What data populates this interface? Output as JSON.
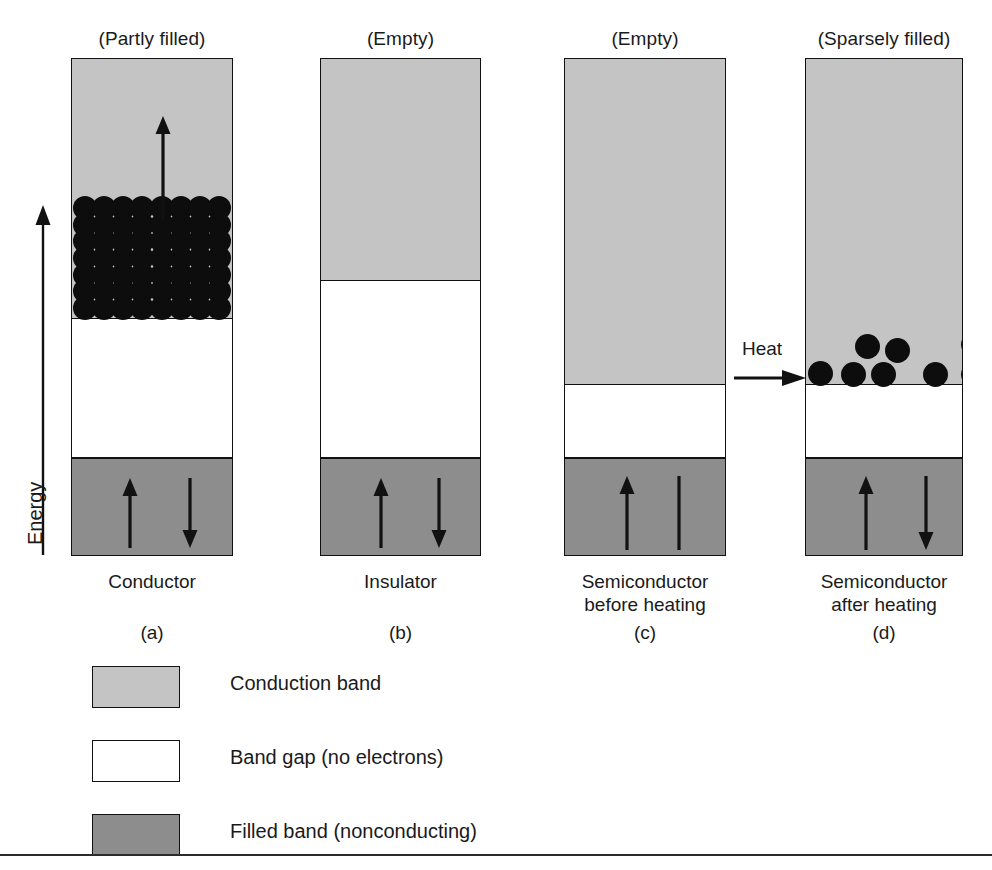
{
  "figure": {
    "axis": {
      "label": "Energy",
      "direction": "up"
    },
    "heat": {
      "label": "Heat",
      "arrow": "right-arrow-icon"
    }
  },
  "columns": [
    {
      "key": "conductor",
      "top_label": "(Partly filled)",
      "bottom_label": "Conductor",
      "panel_letter": "(a)",
      "x": 71,
      "width": 162,
      "y": 58,
      "height": 500,
      "bands": [
        {
          "type": "conduction",
          "label": "Conduction band",
          "top": 0,
          "height": 262
        },
        {
          "type": "gap",
          "label": "Band gap (no electrons)",
          "top": 262,
          "height": 140
        },
        {
          "type": "filled",
          "label": "Filled band (nonconducting)",
          "top": 402,
          "height": 98
        }
      ],
      "fill": {
        "style": "dense-lattice",
        "region_top": 138,
        "region_height": 124,
        "cols": 8,
        "rows": 7,
        "dot_diameter": 24
      },
      "arrows": [
        {
          "name": "conduction-up-arrow",
          "dir": "up",
          "x": 81,
          "y": 58,
          "length": 104
        },
        {
          "name": "filled-up-arrow",
          "dir": "up",
          "x": 48,
          "y": 420,
          "length": 70
        },
        {
          "name": "filled-down-arrow",
          "dir": "down",
          "x": 108,
          "y": 420,
          "length": 70
        }
      ]
    },
    {
      "key": "insulator",
      "top_label": "(Empty)",
      "bottom_label": "Insulator",
      "panel_letter": "(b)",
      "x": 320,
      "width": 161,
      "y": 58,
      "height": 500,
      "bands": [
        {
          "type": "conduction",
          "label": "Conduction band",
          "top": 0,
          "height": 224
        },
        {
          "type": "gap",
          "label": "Band gap (no electrons)",
          "top": 224,
          "height": 178
        },
        {
          "type": "filled",
          "label": "Filled band (nonconducting)",
          "top": 402,
          "height": 98
        }
      ],
      "fill": null,
      "arrows": [
        {
          "name": "filled-up-arrow",
          "dir": "up",
          "x": 50,
          "y": 420,
          "length": 70
        },
        {
          "name": "filled-down-arrow",
          "dir": "down",
          "x": 108,
          "y": 420,
          "length": 70
        }
      ]
    },
    {
      "key": "semiconductor-before",
      "top_label": "(Empty)",
      "bottom_label": "Semiconductor\nbefore heating",
      "panel_letter": "(c)",
      "x": 564,
      "width": 162,
      "y": 58,
      "height": 500,
      "bands": [
        {
          "type": "conduction",
          "label": "Conduction band",
          "top": 0,
          "height": 328
        },
        {
          "type": "gap",
          "label": "Band gap (no electrons)",
          "top": 328,
          "height": 74
        },
        {
          "type": "filled",
          "label": "Filled band (nonconducting)",
          "top": 402,
          "height": 98
        }
      ],
      "fill": null,
      "arrows": [
        {
          "name": "filled-up-arrow",
          "dir": "up",
          "x": 52,
          "y": 418,
          "length": 74
        },
        {
          "name": "filled-line",
          "dir": "line",
          "x": 104,
          "y": 418,
          "length": 74
        }
      ]
    },
    {
      "key": "semiconductor-after",
      "top_label": "(Sparsely filled)",
      "bottom_label": "Semiconductor\nafter heating",
      "panel_letter": "(d)",
      "x": 805,
      "width": 158,
      "y": 58,
      "height": 500,
      "bands": [
        {
          "type": "conduction",
          "label": "Conduction band",
          "top": 0,
          "height": 328
        },
        {
          "type": "gap",
          "label": "Band gap (no electrons)",
          "top": 328,
          "height": 74
        },
        {
          "type": "filled",
          "label": "Filled band (nonconducting)",
          "top": 402,
          "height": 98
        }
      ],
      "fill": {
        "style": "sparse-dots",
        "dot_diameter": 25,
        "dots": [
          {
            "cx": 15,
            "cy": 315
          },
          {
            "cx": 48,
            "cy": 316
          },
          {
            "cx": 78,
            "cy": 316
          },
          {
            "cx": 130,
            "cy": 316
          },
          {
            "cx": 168,
            "cy": 316
          },
          {
            "cx": 62,
            "cy": 288
          },
          {
            "cx": 92,
            "cy": 292
          },
          {
            "cx": 168,
            "cy": 286
          }
        ]
      },
      "arrows": [
        {
          "name": "filled-up-arrow",
          "dir": "up",
          "x": 50,
          "y": 418,
          "length": 74
        },
        {
          "name": "filled-down-arrow",
          "dir": "down",
          "x": 110,
          "y": 418,
          "length": 74
        }
      ]
    }
  ],
  "legend": [
    {
      "type": "conduction",
      "label": "Conduction band"
    },
    {
      "type": "gap",
      "label": "Band gap (no electrons)"
    },
    {
      "type": "filled",
      "label": "Filled band (nonconducting)"
    }
  ],
  "colors": {
    "conduction_band": "#c4c4c4",
    "band_gap": "#ffffff",
    "filled_band": "#8d8d8d",
    "electron": "#0d0d0d",
    "outline": "#111111",
    "text": "#1a1a1a"
  }
}
